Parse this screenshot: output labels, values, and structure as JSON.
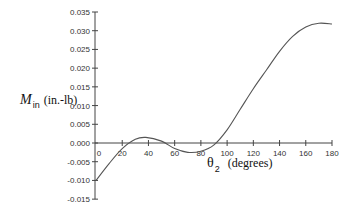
{
  "chart_data": {
    "type": "line",
    "title": "",
    "xlabel": "θ2 (degrees)",
    "ylabel": "M in (in.-lb)",
    "xlim": [
      0,
      180
    ],
    "ylim": [
      -0.015,
      0.035
    ],
    "grid": false,
    "legend": null,
    "x_ticks": [
      "0",
      "20",
      "40",
      "60",
      "80",
      "100",
      "120",
      "140",
      "160",
      "180"
    ],
    "y_ticks": [
      "0.035",
      "0.030",
      "0.025",
      "0.020",
      "0.015",
      "0.010",
      "0.005",
      "0.000",
      "-0.005",
      "-0.010",
      "-0.015"
    ],
    "series": [
      {
        "name": "M_in",
        "x": [
          0,
          10,
          20,
          30,
          38,
          50,
          60,
          70,
          80,
          90,
          100,
          110,
          120,
          130,
          140,
          150,
          160,
          170,
          180
        ],
        "values": [
          -0.01,
          -0.0055,
          -0.0015,
          0.001,
          0.0015,
          0.0005,
          -0.0015,
          -0.0025,
          -0.0022,
          -0.0005,
          0.0035,
          0.009,
          0.0145,
          0.0195,
          0.0245,
          0.0285,
          0.031,
          0.032,
          0.0318
        ]
      }
    ]
  },
  "labels": {
    "y_main": "M",
    "y_sub": "in",
    "y_units": "(in.-lb)",
    "x_main": "θ",
    "x_sub": "2",
    "x_units": "(degrees)"
  },
  "colors": {
    "axis": "#444444",
    "line": "#555555"
  }
}
